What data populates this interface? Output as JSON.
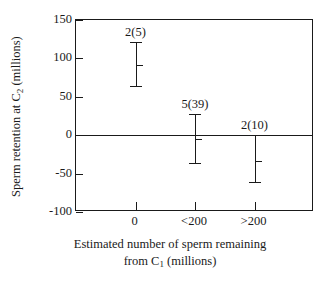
{
  "chart_data": {
    "type": "scatter",
    "title": "",
    "xlabel_line1": "Estimated number of sperm remaining",
    "xlabel_line2_pre": "from C",
    "xlabel_line2_sub": "1",
    "xlabel_line2_post": " (millions)",
    "ylabel_pre": "Sperm retention at C",
    "ylabel_sub": "2",
    "ylabel_post": " (millions)",
    "categories": [
      "0",
      "<200",
      ">200"
    ],
    "xtick_labels": [
      "0",
      "<200",
      ">200"
    ],
    "ytick_labels": [
      "150",
      "100",
      "50",
      "0",
      "-50",
      "-100"
    ],
    "ytick_values": [
      150,
      100,
      50,
      0,
      -50,
      -100
    ],
    "ylim": [
      -100,
      150
    ],
    "grid": false,
    "legend": "none",
    "zero_line": 0,
    "series": [
      {
        "name": "Sperm retention at C2",
        "points": [
          {
            "category": "0",
            "mean": 92,
            "upper": 122,
            "lower": 63,
            "annotation": "2(5)"
          },
          {
            "category": "<200",
            "mean": -5,
            "upper": 27,
            "lower": -38,
            "annotation": "5(39)"
          },
          {
            "category": ">200",
            "mean": -33,
            "upper": 0,
            "lower": -62,
            "annotation": "2(10)"
          }
        ]
      }
    ],
    "annotations": [
      "2(5)",
      "5(39)",
      "2(10)"
    ],
    "annotation_note": "n_males(n_matings)",
    "colors": {
      "axis": "#1a1a1a",
      "marker": "#1a1a1a",
      "background": "#ffffff"
    }
  }
}
